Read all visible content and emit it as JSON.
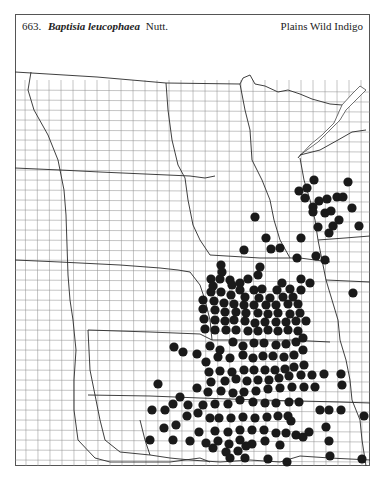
{
  "header": {
    "number": "663.",
    "scientific_name": "Baptisia leucophaea",
    "author": "Nutt.",
    "common_name": "Plains Wild Indigo"
  },
  "map": {
    "frame": {
      "x": 15,
      "y": 14,
      "w": 355,
      "h": 452
    },
    "dot_color": "#1a1a1a",
    "dot_radius": 4.6,
    "occurrences": [
      [
        314,
        180
      ],
      [
        348,
        182
      ],
      [
        299,
        191
      ],
      [
        307,
        188
      ],
      [
        305,
        198
      ],
      [
        319,
        201
      ],
      [
        313,
        207
      ],
      [
        327,
        199
      ],
      [
        337,
        197
      ],
      [
        343,
        197
      ],
      [
        313,
        212
      ],
      [
        325,
        213
      ],
      [
        331,
        211
      ],
      [
        352,
        208
      ],
      [
        333,
        226
      ],
      [
        339,
        220
      ],
      [
        318,
        227
      ],
      [
        329,
        233
      ],
      [
        359,
        226
      ],
      [
        255,
        217
      ],
      [
        266,
        238
      ],
      [
        301,
        238
      ],
      [
        271,
        249
      ],
      [
        280,
        248
      ],
      [
        244,
        250
      ],
      [
        297,
        258
      ],
      [
        316,
        256
      ],
      [
        325,
        260
      ],
      [
        353,
        293
      ],
      [
        260,
        267
      ],
      [
        221,
        265
      ],
      [
        222,
        272
      ],
      [
        258,
        275
      ],
      [
        248,
        279
      ],
      [
        211,
        279
      ],
      [
        220,
        279
      ],
      [
        230,
        280
      ],
      [
        240,
        283
      ],
      [
        301,
        279
      ],
      [
        310,
        283
      ],
      [
        282,
        283
      ],
      [
        232,
        285
      ],
      [
        213,
        286
      ],
      [
        240,
        290
      ],
      [
        254,
        290
      ],
      [
        262,
        289
      ],
      [
        277,
        290
      ],
      [
        290,
        289
      ],
      [
        301,
        290
      ],
      [
        211,
        292
      ],
      [
        221,
        292
      ],
      [
        231,
        295
      ],
      [
        245,
        297
      ],
      [
        259,
        298
      ],
      [
        270,
        298
      ],
      [
        283,
        297
      ],
      [
        293,
        297
      ],
      [
        203,
        300
      ],
      [
        214,
        301
      ],
      [
        224,
        303
      ],
      [
        234,
        304
      ],
      [
        244,
        305
      ],
      [
        254,
        305
      ],
      [
        266,
        305
      ],
      [
        276,
        305
      ],
      [
        288,
        304
      ],
      [
        298,
        304
      ],
      [
        203,
        309
      ],
      [
        215,
        310
      ],
      [
        225,
        312
      ],
      [
        236,
        312
      ],
      [
        246,
        313
      ],
      [
        258,
        313
      ],
      [
        268,
        314
      ],
      [
        278,
        313
      ],
      [
        290,
        314
      ],
      [
        300,
        313
      ],
      [
        204,
        319
      ],
      [
        215,
        320
      ],
      [
        225,
        321
      ],
      [
        234,
        320
      ],
      [
        245,
        321
      ],
      [
        255,
        323
      ],
      [
        265,
        322
      ],
      [
        276,
        322
      ],
      [
        286,
        322
      ],
      [
        296,
        321
      ],
      [
        306,
        321
      ],
      [
        205,
        329
      ],
      [
        215,
        330
      ],
      [
        226,
        330
      ],
      [
        236,
        330
      ],
      [
        248,
        331
      ],
      [
        258,
        331
      ],
      [
        268,
        330
      ],
      [
        278,
        331
      ],
      [
        288,
        330
      ],
      [
        298,
        331
      ],
      [
        174,
        347
      ],
      [
        183,
        352
      ],
      [
        197,
        354
      ],
      [
        210,
        346
      ],
      [
        220,
        350
      ],
      [
        233,
        342
      ],
      [
        243,
        346
      ],
      [
        254,
        343
      ],
      [
        264,
        343
      ],
      [
        276,
        345
      ],
      [
        286,
        344
      ],
      [
        296,
        342
      ],
      [
        303,
        338
      ],
      [
        206,
        362
      ],
      [
        218,
        357
      ],
      [
        230,
        358
      ],
      [
        243,
        355
      ],
      [
        253,
        358
      ],
      [
        263,
        356
      ],
      [
        273,
        356
      ],
      [
        284,
        357
      ],
      [
        294,
        355
      ],
      [
        303,
        350
      ],
      [
        209,
        372
      ],
      [
        220,
        371
      ],
      [
        232,
        372
      ],
      [
        244,
        370
      ],
      [
        254,
        370
      ],
      [
        265,
        370
      ],
      [
        275,
        370
      ],
      [
        285,
        369
      ],
      [
        294,
        367
      ],
      [
        304,
        365
      ],
      [
        211,
        382
      ],
      [
        225,
        381
      ],
      [
        236,
        379
      ],
      [
        247,
        381
      ],
      [
        258,
        380
      ],
      [
        269,
        380
      ],
      [
        279,
        378
      ],
      [
        289,
        376
      ],
      [
        301,
        375
      ],
      [
        312,
        375
      ],
      [
        324,
        374
      ],
      [
        341,
        374
      ],
      [
        342,
        385
      ],
      [
        158,
        384
      ],
      [
        180,
        397
      ],
      [
        197,
        388
      ],
      [
        208,
        392
      ],
      [
        221,
        391
      ],
      [
        233,
        393
      ],
      [
        244,
        392
      ],
      [
        256,
        391
      ],
      [
        268,
        389
      ],
      [
        280,
        388
      ],
      [
        292,
        387
      ],
      [
        304,
        387
      ],
      [
        315,
        387
      ],
      [
        173,
        404
      ],
      [
        188,
        405
      ],
      [
        203,
        405
      ],
      [
        215,
        404
      ],
      [
        228,
        404
      ],
      [
        240,
        400
      ],
      [
        253,
        402
      ],
      [
        265,
        403
      ],
      [
        276,
        403
      ],
      [
        289,
        402
      ],
      [
        299,
        402
      ],
      [
        320,
        410
      ],
      [
        329,
        410
      ],
      [
        341,
        410
      ],
      [
        364,
        416
      ],
      [
        152,
        410
      ],
      [
        165,
        410
      ],
      [
        187,
        416
      ],
      [
        198,
        413
      ],
      [
        210,
        418
      ],
      [
        219,
        418
      ],
      [
        231,
        418
      ],
      [
        243,
        417
      ],
      [
        255,
        418
      ],
      [
        267,
        417
      ],
      [
        278,
        416
      ],
      [
        288,
        416
      ],
      [
        291,
        421
      ],
      [
        164,
        428
      ],
      [
        176,
        425
      ],
      [
        199,
        432
      ],
      [
        215,
        431
      ],
      [
        228,
        432
      ],
      [
        240,
        430
      ],
      [
        252,
        430
      ],
      [
        264,
        430
      ],
      [
        276,
        433
      ],
      [
        286,
        433
      ],
      [
        296,
        435
      ],
      [
        309,
        432
      ],
      [
        326,
        427
      ],
      [
        150,
        440
      ],
      [
        173,
        440
      ],
      [
        190,
        441
      ],
      [
        206,
        443
      ],
      [
        218,
        441
      ],
      [
        229,
        444
      ],
      [
        240,
        440
      ],
      [
        252,
        444
      ],
      [
        265,
        441
      ],
      [
        280,
        445
      ],
      [
        303,
        437
      ],
      [
        329,
        441
      ],
      [
        213,
        448
      ],
      [
        226,
        452
      ],
      [
        238,
        451
      ],
      [
        246,
        446
      ],
      [
        230,
        458
      ],
      [
        245,
        458
      ],
      [
        268,
        459
      ],
      [
        287,
        462
      ],
      [
        330,
        456
      ],
      [
        362,
        459
      ]
    ]
  }
}
